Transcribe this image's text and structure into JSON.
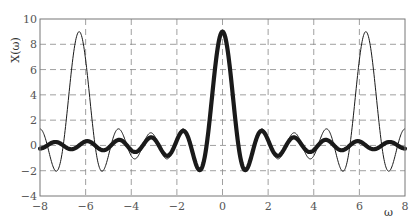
{
  "chart_data": {
    "type": "line",
    "title": "",
    "xlabel": "ω",
    "ylabel": "X(ω)",
    "xlim": [
      -8,
      8
    ],
    "ylim": [
      -4,
      10
    ],
    "xticks": [
      -8,
      -6,
      -4,
      -2,
      0,
      2,
      4,
      6,
      8
    ],
    "yticks": [
      -4,
      -2,
      0,
      2,
      4,
      6,
      8,
      10
    ],
    "xtick_labels": [
      "-8",
      "-6",
      "-4",
      "-2",
      "0",
      "2",
      "4",
      "6",
      "8"
    ],
    "ytick_labels": [
      "-4",
      "-2",
      "0",
      "2",
      "4",
      "6",
      "8",
      "10"
    ],
    "grid": true,
    "grid_style": "dashed",
    "legend": null,
    "x": [
      -8,
      -7.5,
      -7,
      -6.5,
      -6,
      -5.5,
      -5,
      -4.5,
      -4,
      -3.5,
      -3,
      -2.5,
      -2,
      -1.5,
      -1,
      -0.5,
      0,
      0.5,
      1,
      1.5,
      2,
      2.5,
      3,
      3.5,
      4,
      4.5,
      5,
      5.5,
      6,
      6.5,
      7,
      7.5,
      8
    ],
    "series": [
      {
        "name": "periodic spectrum (thin line)",
        "style": "thin",
        "formula": "sin(4.5ω)/sin(ω/2)",
        "values": [
          1.31,
          -1.38,
          0.0,
          7.69,
          6.78,
          -1.0,
          -0.81,
          1.27,
          -0.83,
          0.0,
          0.81,
          -1.03,
          0.49,
          0.66,
          -2.04,
          3.15,
          9.0,
          3.15,
          -2.04,
          0.66,
          0.49,
          -1.03,
          0.81,
          0.0,
          -0.83,
          1.27,
          -0.81,
          -1.0,
          6.78,
          7.69,
          0.0,
          -1.38,
          1.31
        ]
      },
      {
        "name": "aperiodic spectrum (thick line)",
        "style": "thick",
        "formula": "sin(4.5ω)/(ω/2)",
        "values": [
          -0.25,
          0.21,
          0.0,
          -0.26,
          0.32,
          -0.14,
          -0.19,
          0.44,
          -0.38,
          0.0,
          0.54,
          -0.78,
          0.41,
          0.6,
          -1.96,
          3.11,
          9.0,
          3.11,
          -1.96,
          0.6,
          0.41,
          -0.78,
          0.54,
          0.0,
          -0.38,
          0.44,
          -0.19,
          -0.14,
          0.32,
          -0.26,
          0.0,
          0.21,
          -0.25
        ]
      }
    ]
  },
  "colors": {
    "line": "#1a1a1a",
    "grid": "#888888",
    "frame": "#777777",
    "tick_text": "#555555"
  }
}
